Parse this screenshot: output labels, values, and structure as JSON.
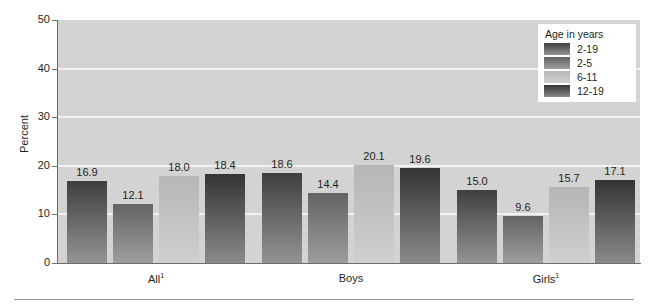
{
  "chart_data": {
    "type": "bar",
    "title": "",
    "xlabel": "",
    "ylabel": "Percent",
    "ylim": [
      0,
      50
    ],
    "yticks": [
      "0",
      "10",
      "20",
      "30",
      "40",
      "50"
    ],
    "ytick_values": [
      0,
      10,
      20,
      30,
      40,
      50
    ],
    "gridlines": [
      10,
      20,
      30,
      40
    ],
    "grid": true,
    "categories": [
      "All¹",
      "Boys",
      "Girls¹"
    ],
    "category_labels": [
      {
        "text": "All",
        "sup": "1"
      },
      {
        "text": "Boys",
        "sup": ""
      },
      {
        "text": "Girls",
        "sup": "1"
      }
    ],
    "legend_title": "Age in years",
    "legend_position": "top-right",
    "series": [
      {
        "name": "2-19",
        "values": [
          16.9,
          18.6,
          15.0
        ],
        "color_top": "#3f3f3f",
        "color_bottom": "#949494"
      },
      {
        "name": "2-5",
        "values": [
          12.1,
          14.4,
          9.6
        ],
        "color_top": "#636363",
        "color_bottom": "#9e9e9e"
      },
      {
        "name": "6-11",
        "values": [
          18.0,
          20.1,
          15.7
        ],
        "color_top": "#b6b6b6",
        "color_bottom": "#cfcfcf"
      },
      {
        "name": "12-19",
        "values": [
          18.4,
          19.6,
          17.1
        ],
        "color_top": "#343434",
        "color_bottom": "#8a8a8a"
      }
    ],
    "data_labels": [
      [
        "16.9",
        "12.1",
        "18.0",
        "18.4"
      ],
      [
        "18.6",
        "14.4",
        "20.1",
        "19.6"
      ],
      [
        "15.0",
        "9.6",
        "15.7",
        "17.1"
      ]
    ],
    "plot_background": "#d3d3d3",
    "gridline_color": "#f2f2f2",
    "axis_color": "#6d6e71",
    "text_color": "#231f20"
  }
}
